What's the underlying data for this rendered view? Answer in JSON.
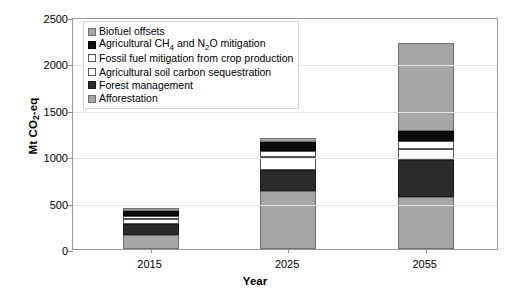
{
  "chart_data": {
    "type": "bar",
    "stacked": true,
    "title": "",
    "xlabel": "Year",
    "ylabel": "Mt CO2-eq",
    "ylabel_rich": "Mt CO₂-eq",
    "categories": [
      "2015",
      "2025",
      "2055"
    ],
    "ylim": [
      0,
      2500
    ],
    "yticks": [
      0,
      500,
      1000,
      1500,
      2000,
      2500
    ],
    "ytick_labels": [
      "0",
      "500",
      "1000",
      "1500",
      "2000",
      "2500"
    ],
    "grid": true,
    "legend_position": "upper-left-inside",
    "series": [
      {
        "name": "Afforestation",
        "color": "#a6a6a6",
        "swatch": "gray",
        "values": [
          150,
          620,
          560
        ]
      },
      {
        "name": "Forest management",
        "color": "#2b2b2b",
        "swatch": "dark",
        "values": [
          120,
          230,
          400
        ]
      },
      {
        "name": "Agricultural soil carbon sequestration",
        "color": "#ffffff",
        "swatch": "white",
        "values": [
          50,
          140,
          120
        ]
      },
      {
        "name": "Fossil fuel mitigation from crop production",
        "color": "#ffffff",
        "swatch": "white",
        "values": [
          35,
          70,
          80
        ]
      },
      {
        "name": "Agricultural CH4 and N2O mitigation",
        "color": "#0d0d0d",
        "swatch": "black",
        "values": [
          55,
          90,
          110
        ]
      },
      {
        "name": "Biofuel offsets",
        "color": "#a6a6a6",
        "swatch": "gray",
        "values": [
          30,
          50,
          950
        ]
      }
    ],
    "totals": [
      440,
      1200,
      2220
    ]
  },
  "axes": {
    "y_title": "Mt CO",
    "y_title_sub": "2",
    "y_title_tail": "-eq",
    "x_title": "Year"
  },
  "legend": {
    "items": [
      {
        "label": "Biofuel offsets",
        "swatch": "gray"
      },
      {
        "label": "Agricultural CH4 and N2O mitigation",
        "swatch": "black"
      },
      {
        "label": "Fossil fuel mitigation from crop production",
        "swatch": "white"
      },
      {
        "label": "Agricultural soil carbon sequestration",
        "swatch": "white"
      },
      {
        "label": "Forest management",
        "swatch": "dark"
      },
      {
        "label": "Afforestation",
        "swatch": "gray"
      }
    ]
  }
}
